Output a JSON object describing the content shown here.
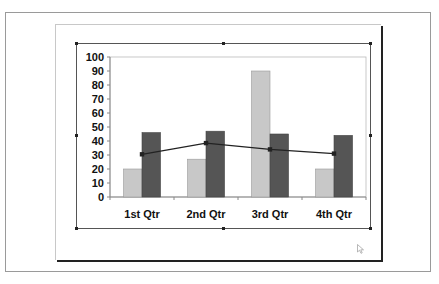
{
  "chart_data": {
    "type": "bar",
    "title": "",
    "xlabel": "",
    "ylabel": "",
    "categories": [
      "1st Qtr",
      "2nd Qtr",
      "3rd Qtr",
      "4th Qtr"
    ],
    "ylim": [
      0,
      100
    ],
    "yticks": [
      0,
      10,
      20,
      30,
      40,
      50,
      60,
      70,
      80,
      90,
      100
    ],
    "yticks_labels": [
      "0",
      "10",
      "20",
      "30",
      "40",
      "50",
      "60",
      "70",
      "80",
      "90",
      "100"
    ],
    "grid": false,
    "legend": null,
    "series": [
      {
        "name": "Series 1",
        "kind": "bar",
        "color": "#c8c8c8",
        "values": [
          20,
          27,
          90,
          20
        ]
      },
      {
        "name": "Series 2",
        "kind": "bar",
        "color": "#555555",
        "values": [
          46,
          47,
          45,
          44
        ]
      },
      {
        "name": "Series 3",
        "kind": "line",
        "color": "#222222",
        "values": [
          30.5,
          38.5,
          34,
          31
        ]
      }
    ]
  },
  "colors": {
    "frame": "#9a9a9a",
    "axis": "#888888",
    "text": "#111111"
  },
  "icons": {
    "cursor": "mouse-pointer-icon"
  }
}
